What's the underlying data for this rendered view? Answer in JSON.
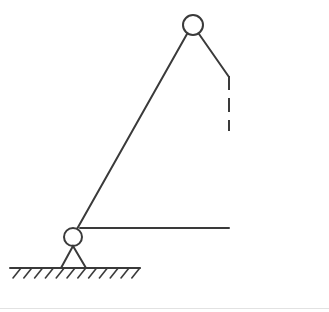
{
  "figure": {
    "background_color": "#ffffff",
    "stroke_color": "#3a3a3a",
    "separator_color": "#e2e2e2",
    "width": 329,
    "height": 312,
    "stroke_width": 2
  },
  "geometry": {
    "top_joint": {
      "cx": 193,
      "cy": 25,
      "r": 10
    },
    "bottom_joint": {
      "cx": 73,
      "cy": 237,
      "r": 9
    },
    "long_strut": {
      "x1": 187,
      "y1": 34,
      "x2": 77,
      "y2": 229
    },
    "short_strut": {
      "x1": 199,
      "y1": 34,
      "x2": 229,
      "y2": 77
    },
    "horizontal_member": {
      "x1": 80,
      "y1": 228,
      "x2": 229,
      "y2": 228
    },
    "dashed_line": {
      "x": 229,
      "y1": 76,
      "y2": 131,
      "dash": 14,
      "gap": 8
    },
    "support_triangle": {
      "apex_x": 73,
      "apex_y": 246,
      "base_left_x": 61,
      "base_right_x": 86,
      "base_y": 268
    },
    "ground_line": {
      "x1": 10,
      "y1": 268,
      "x2": 140,
      "y2": 268
    },
    "hatching": {
      "count": 12,
      "start_x": 13,
      "spacing": 10.8,
      "run": 8,
      "rise": 10
    }
  }
}
